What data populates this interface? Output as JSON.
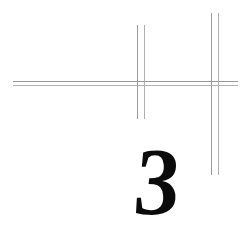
{
  "page": {
    "kind": "scanned-page-fragment",
    "width": 242,
    "height": 229,
    "background_color": "#ffffff",
    "ink_color": "#0b0b0b",
    "rule_color": "#9a9a9a",
    "rule_color_soft": "#b2b2b2"
  },
  "numeral": {
    "value": "3",
    "label": "page-number-3"
  },
  "rules": {
    "horizontal": [
      {
        "name": "horizontal-rule-upper",
        "x": 13,
        "y": 81,
        "length": 225,
        "tone": "dark"
      },
      {
        "name": "horizontal-rule-lower",
        "x": 13,
        "y": 85,
        "length": 225,
        "tone": "soft"
      }
    ],
    "vertical": [
      {
        "name": "vertical-rule-left-inner",
        "x": 137,
        "y": 25,
        "length": 94,
        "tone": "dark"
      },
      {
        "name": "vertical-rule-left-outer",
        "x": 144,
        "y": 25,
        "length": 94,
        "tone": "soft"
      },
      {
        "name": "vertical-rule-right-inner",
        "x": 211,
        "y": 13,
        "length": 162,
        "tone": "dark"
      },
      {
        "name": "vertical-rule-right-outer",
        "x": 218,
        "y": 13,
        "length": 162,
        "tone": "soft"
      }
    ]
  }
}
